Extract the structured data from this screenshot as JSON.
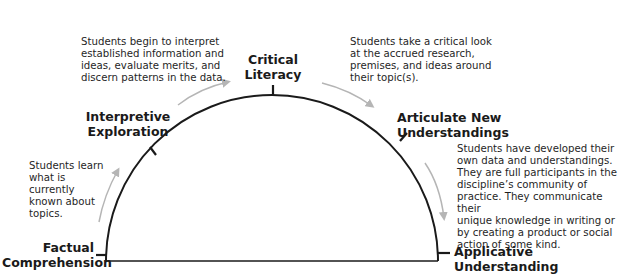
{
  "diagram": {
    "type": "semicircle-progression",
    "stages": [
      {
        "id": "factual",
        "line1": "Factual",
        "line2": "Comprehension"
      },
      {
        "id": "interpretive",
        "line1": "Interpretive",
        "line2": "Exploration"
      },
      {
        "id": "critical",
        "line1": "Critical",
        "line2": "Literacy"
      },
      {
        "id": "articulate",
        "line1": "Articulate New",
        "line2": "Understandings"
      },
      {
        "id": "applicative",
        "line1": "Applicative",
        "line2": "Understanding"
      }
    ],
    "descriptions": {
      "factual_to_interpretive": [
        "Students learn",
        "what is currently",
        "known about",
        "topics."
      ],
      "interpretive_to_critical": [
        "Students begin to interpret",
        "established information and",
        "ideas, evaluate merits, and",
        "discern patterns in the data."
      ],
      "critical_to_articulate": [
        "Students take a critical look",
        "at the accrued research,",
        "premises, and ideas around",
        "their topic(s)."
      ],
      "articulate_to_applicative": [
        "Students have developed their",
        "own data and understandings.",
        "They are full participants in the",
        "discipline’s community of",
        "practice. They communicate their",
        "unique knowledge in writing or",
        "by creating a product or social",
        "action of some kind."
      ]
    },
    "colors": {
      "line": "#1a1a1a",
      "arrow": "#b5b5b5"
    }
  }
}
